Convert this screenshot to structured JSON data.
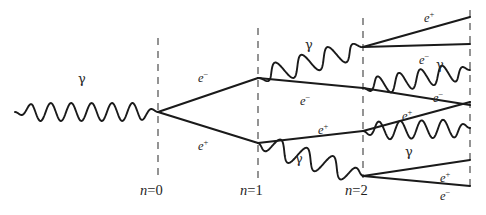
{
  "figure": {
    "kind": "electromagnetic-shower-diagram",
    "background_color": "#ffffff",
    "ink_color": "#1a1a1a",
    "dash_color": "#4d4d4d",
    "width": 486,
    "height": 215
  },
  "generations": [
    {
      "id": "n0",
      "label_n": "n",
      "label_eq": "=",
      "label_value": "0",
      "label_full": "n=0",
      "x": 158,
      "y_top": 38,
      "y_bottom": 178,
      "label_x": 140,
      "label_y": 183
    },
    {
      "id": "n1",
      "label_n": "n",
      "label_eq": "=",
      "label_value": "1",
      "label_full": "n=1",
      "x": 258,
      "y_top": 28,
      "y_bottom": 178,
      "label_x": 240,
      "label_y": 183
    },
    {
      "id": "n2",
      "label_n": "n",
      "label_eq": "=",
      "label_value": "2",
      "label_full": "n=2",
      "x": 363,
      "y_top": 18,
      "y_bottom": 178,
      "label_x": 345,
      "label_y": 183
    },
    {
      "id": "n3",
      "label_n": "",
      "label_eq": "",
      "label_value": "",
      "label_full": "",
      "x": 470,
      "y_top": 10,
      "y_bottom": 190,
      "label_x": 0,
      "label_y": 0
    }
  ],
  "labels": [
    {
      "id": "gamma-incoming",
      "text": "γ",
      "type": "gamma",
      "x": 78,
      "y": 72
    },
    {
      "id": "e-minus-gen0",
      "text": "e",
      "sup": "−",
      "type": "particle",
      "x": 198,
      "y": 72
    },
    {
      "id": "e-plus-gen0",
      "text": "e",
      "sup": "+",
      "type": "particle",
      "x": 198,
      "y": 140
    },
    {
      "id": "gamma-top-gen1",
      "text": "γ",
      "type": "gamma",
      "x": 305,
      "y": 38
    },
    {
      "id": "e-minus-gen1",
      "text": "e",
      "sup": "−",
      "type": "particle",
      "x": 300,
      "y": 95
    },
    {
      "id": "e-plus-gen1",
      "text": "e",
      "sup": "+",
      "type": "particle",
      "x": 318,
      "y": 124
    },
    {
      "id": "gamma-bot-gen1",
      "text": "γ",
      "type": "gamma",
      "x": 295,
      "y": 152
    },
    {
      "id": "e-plus-top-gen2",
      "text": "e",
      "sup": "+",
      "type": "particle",
      "x": 424,
      "y": 12
    },
    {
      "id": "e-minus-top-gen2",
      "text": "e",
      "sup": "−",
      "type": "particle",
      "x": 419,
      "y": 54
    },
    {
      "id": "gamma-top-gen2",
      "text": "γ",
      "type": "gamma",
      "x": 436,
      "y": 58
    },
    {
      "id": "e-minus-mid-gen2",
      "text": "e",
      "sup": "−",
      "type": "particle",
      "x": 433,
      "y": 92
    },
    {
      "id": "e-plus-mid-gen2",
      "text": "e",
      "sup": "+",
      "type": "particle",
      "x": 402,
      "y": 110
    },
    {
      "id": "gamma-bot-gen2",
      "text": "γ",
      "type": "gamma",
      "x": 405,
      "y": 145
    },
    {
      "id": "e-plus-bot-gen2",
      "text": "e",
      "sup": "+",
      "type": "particle",
      "x": 440,
      "y": 172
    },
    {
      "id": "e-minus-bot-gen2",
      "text": "e",
      "sup": "−",
      "type": "particle",
      "x": 440,
      "y": 190
    }
  ],
  "tracks": [
    {
      "id": "e-minus-0-1",
      "particle": "e-",
      "from": [
        158,
        112
      ],
      "to": [
        258,
        78
      ]
    },
    {
      "id": "e-plus-0-1",
      "particle": "e+",
      "from": [
        158,
        112
      ],
      "to": [
        258,
        143
      ]
    },
    {
      "id": "e-minus-1-2",
      "particle": "e-",
      "from": [
        258,
        78
      ],
      "to": [
        363,
        88
      ]
    },
    {
      "id": "e-plus-1-2",
      "particle": "e+",
      "from": [
        258,
        143
      ],
      "to": [
        363,
        131
      ]
    },
    {
      "id": "e-plus-top-out",
      "particle": "e+",
      "from": [
        363,
        47
      ],
      "to": [
        470,
        17
      ]
    },
    {
      "id": "e-minus-top-out",
      "particle": "e-",
      "from": [
        363,
        47
      ],
      "to": [
        470,
        44
      ]
    },
    {
      "id": "e-minus-mid-out",
      "particle": "e-",
      "from": [
        363,
        88
      ],
      "to": [
        470,
        105
      ]
    },
    {
      "id": "e-plus-mid-out",
      "particle": "e+",
      "from": [
        363,
        131
      ],
      "to": [
        470,
        102
      ]
    },
    {
      "id": "e-plus-bot-out",
      "particle": "e+",
      "from": [
        363,
        176
      ],
      "to": [
        470,
        160
      ]
    },
    {
      "id": "e-minus-bot-out",
      "particle": "e-",
      "from": [
        363,
        176
      ],
      "to": [
        470,
        186
      ]
    }
  ],
  "photons": [
    {
      "id": "gamma-incoming-wave",
      "from": [
        15,
        112
      ],
      "to": [
        158,
        112
      ],
      "cycles": 7,
      "amplitude": 9
    },
    {
      "id": "gamma-top-1-2",
      "from": [
        258,
        78
      ],
      "to": [
        363,
        47
      ],
      "cycles": 4,
      "amplitude": 10
    },
    {
      "id": "gamma-bot-1-2",
      "from": [
        258,
        143
      ],
      "to": [
        363,
        176
      ],
      "cycles": 4,
      "amplitude": 10
    },
    {
      "id": "gamma-top-2-out",
      "from": [
        363,
        88
      ],
      "to": [
        470,
        70
      ],
      "cycles": 5,
      "amplitude": 9
    },
    {
      "id": "gamma-bot-2-out",
      "from": [
        363,
        131
      ],
      "to": [
        470,
        128
      ],
      "cycles": 5,
      "amplitude": 9
    }
  ]
}
